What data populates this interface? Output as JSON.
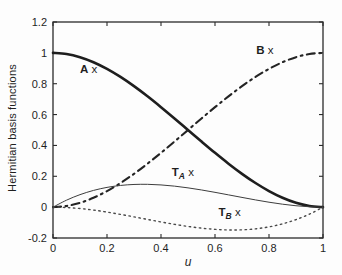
{
  "figure": {
    "background": "#fdfdfd",
    "axis_color": "#2b2b2b",
    "text_color": "#1f1f1f"
  },
  "chart_data": {
    "type": "line",
    "title": "",
    "xlabel": "u",
    "ylabel": "Hermitian basis functions",
    "xlim": [
      0,
      1
    ],
    "ylim": [
      -0.2,
      1.2
    ],
    "xticks": [
      0,
      0.2,
      0.4,
      0.6,
      0.8,
      1
    ],
    "xtick_labels": [
      "0",
      "0.2",
      "0.4",
      "0.6",
      "0.8",
      "1"
    ],
    "yticks": [
      -0.2,
      0,
      0.2,
      0.4,
      0.6,
      0.8,
      1,
      1.2
    ],
    "ytick_labels": [
      "-0.2",
      "0",
      "0.2",
      "0.4",
      "0.6",
      "0.8",
      "1",
      "1.2"
    ],
    "grid": false,
    "legend": "inline-annotations",
    "x": [
      0,
      0.05,
      0.1,
      0.15,
      0.2,
      0.25,
      0.3,
      0.35,
      0.4,
      0.45,
      0.5,
      0.55,
      0.6,
      0.65,
      0.7,
      0.75,
      0.8,
      0.85,
      0.9,
      0.95,
      1
    ],
    "series": [
      {
        "name": "A",
        "description": "Hermite basis h00 = 2u^3 - 3u^2 + 1",
        "style": "solid",
        "width": 2.6,
        "color": "#1e1e1e",
        "values": [
          1,
          0.9928,
          0.972,
          0.9393,
          0.896,
          0.8438,
          0.784,
          0.7183,
          0.648,
          0.5748,
          0.5,
          0.4253,
          0.352,
          0.2818,
          0.216,
          0.1563,
          0.104,
          0.0608,
          0.028,
          0.0073,
          0
        ]
      },
      {
        "name": "B",
        "description": "Hermite basis h01 = 3u^2 - 2u^3",
        "style": "dashdot",
        "width": 2.1,
        "color": "#242424",
        "values": [
          0,
          0.0073,
          0.028,
          0.0608,
          0.104,
          0.1563,
          0.216,
          0.2818,
          0.352,
          0.4253,
          0.5,
          0.5748,
          0.648,
          0.7183,
          0.784,
          0.8438,
          0.896,
          0.9393,
          0.972,
          0.9928,
          1
        ]
      },
      {
        "name": "TA",
        "description": "Hermite basis h10 = u^3 - 2u^2 + u",
        "style": "solid",
        "width": 1.0,
        "color": "#3d3d3d",
        "values": [
          0,
          0.0451,
          0.081,
          0.1084,
          0.128,
          0.1406,
          0.147,
          0.1479,
          0.144,
          0.1361,
          0.125,
          0.1114,
          0.096,
          0.0796,
          0.063,
          0.0469,
          0.032,
          0.0191,
          0.009,
          0.0024,
          0
        ]
      },
      {
        "name": "TB",
        "description": "Hermite basis h11 = u^3 - u^2",
        "style": "dotted",
        "width": 1.4,
        "color": "#4a4a4a",
        "values": [
          0,
          -0.0024,
          -0.009,
          -0.0191,
          -0.032,
          -0.0469,
          -0.063,
          -0.0796,
          -0.096,
          -0.1114,
          -0.125,
          -0.1361,
          -0.144,
          -0.1479,
          -0.147,
          -0.1406,
          -0.128,
          -0.1084,
          -0.081,
          -0.0451,
          0
        ]
      }
    ],
    "annotations": [
      {
        "name": "A",
        "main": "A",
        "sub": "",
        "suffix": " x",
        "x": 0.132,
        "y": 0.895
      },
      {
        "name": "B",
        "main": "B",
        "sub": "",
        "suffix": " x",
        "x": 0.785,
        "y": 1.018
      },
      {
        "name": "TA",
        "main": "T",
        "sub": "A",
        "suffix": " x",
        "x": 0.481,
        "y": 0.228
      },
      {
        "name": "TB",
        "main": "T",
        "sub": "B",
        "suffix": " x",
        "x": 0.654,
        "y": -0.029
      }
    ]
  }
}
